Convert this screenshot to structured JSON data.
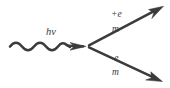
{
  "figure": {
    "background_color": "#ffffff",
    "stroke_color": "#3b3b3b",
    "width": 170,
    "height": 88
  },
  "incoming": {
    "particle": "photon",
    "label": "hv",
    "line_style": "wavy-with-arrowhead",
    "direction": "left-to-right"
  },
  "vertex": {
    "x": 88,
    "y": 46
  },
  "outgoing": [
    {
      "particle": "positron",
      "charge_label": "+e",
      "mass_label": "m",
      "direction": "up-right",
      "line_style": "straight-with-arrowhead"
    },
    {
      "particle": "electron",
      "charge_label": "-e",
      "mass_label": "m",
      "direction": "down-right",
      "line_style": "straight-with-arrowhead"
    }
  ]
}
